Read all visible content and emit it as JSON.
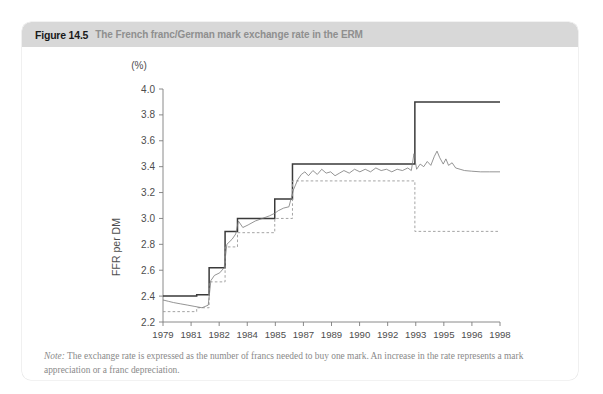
{
  "figure": {
    "number": "Figure 14.5",
    "caption": "The French franc/German mark exchange rate in the ERM",
    "note_label": "Note:",
    "note_text": " The exchange rate is expressed as the number of francs needed to buy one mark. An increase in the rate represents a mark appreciation or a franc depreciation."
  },
  "colors": {
    "header_bar": "#d8d8d8",
    "figure_number": "#1a1a1a",
    "caption": "#8f8f8f",
    "band_upper": "#3a3a3a",
    "band_lower": "#9a9a9a",
    "actual_rate": "#7a7a7a",
    "axis": "#7d7d7d",
    "tick_label": "#4d4d4d",
    "note": "#8a8a8a",
    "card_bg": "#ffffff"
  },
  "chart_data": {
    "type": "line",
    "title": "The French franc/German mark exchange rate in the ERM",
    "xlabel": "",
    "ylabel": "FFR per DM",
    "y_unit_label": "(%)",
    "xlim": [
      1979,
      1998
    ],
    "ylim": [
      2.2,
      4.0
    ],
    "yticks": [
      "4.0",
      "3.8",
      "3.6",
      "3.4",
      "3.2",
      "3.0",
      "2.8",
      "2.6",
      "2.4",
      "2.2"
    ],
    "ytick_values": [
      4.0,
      3.8,
      3.6,
      3.4,
      3.2,
      3.0,
      2.8,
      2.6,
      2.4,
      2.2
    ],
    "xticks": [
      "1979",
      "1981",
      "1982",
      "1984",
      "1985",
      "1987",
      "1989",
      "1990",
      "1992",
      "1993",
      "1995",
      "1996",
      "1998"
    ],
    "xtick_values": [
      1979,
      1981,
      1982,
      1984,
      1985,
      1987,
      1989,
      1990,
      1992,
      1993,
      1995,
      1996,
      1998
    ],
    "grid": false,
    "legend": "none",
    "series": [
      {
        "name": "ERM upper band limit",
        "style": "solid",
        "color": "#3a3a3a",
        "step": true,
        "points": [
          [
            1979.0,
            2.4
          ],
          [
            1980.9,
            2.4
          ],
          [
            1980.9,
            2.41
          ],
          [
            1981.6,
            2.41
          ],
          [
            1981.6,
            2.62
          ],
          [
            1982.5,
            2.62
          ],
          [
            1982.5,
            2.9
          ],
          [
            1983.2,
            2.9
          ],
          [
            1983.2,
            3.0
          ],
          [
            1985.3,
            3.0
          ],
          [
            1985.3,
            3.15
          ],
          [
            1986.3,
            3.15
          ],
          [
            1986.3,
            3.42
          ],
          [
            1993.2,
            3.42
          ],
          [
            1993.2,
            3.9
          ],
          [
            1998.0,
            3.9
          ]
        ]
      },
      {
        "name": "ERM lower band limit",
        "style": "dashed",
        "color": "#9a9a9a",
        "step": true,
        "points": [
          [
            1979.0,
            2.28
          ],
          [
            1980.9,
            2.28
          ],
          [
            1980.9,
            2.31
          ],
          [
            1981.6,
            2.31
          ],
          [
            1981.6,
            2.51
          ],
          [
            1982.5,
            2.51
          ],
          [
            1982.5,
            2.78
          ],
          [
            1983.2,
            2.78
          ],
          [
            1983.2,
            2.89
          ],
          [
            1985.3,
            2.89
          ],
          [
            1985.3,
            3.0
          ],
          [
            1986.3,
            3.0
          ],
          [
            1986.3,
            3.29
          ],
          [
            1993.2,
            3.29
          ],
          [
            1993.2,
            2.9
          ],
          [
            1998.0,
            2.9
          ]
        ]
      },
      {
        "name": "Actual FFR/DM exchange rate",
        "style": "solid-thin",
        "color": "#7a7a7a",
        "step": false,
        "points": [
          [
            1979.0,
            2.37
          ],
          [
            1979.3,
            2.36
          ],
          [
            1979.6,
            2.35
          ],
          [
            1980.0,
            2.34
          ],
          [
            1980.4,
            2.33
          ],
          [
            1980.8,
            2.32
          ],
          [
            1981.2,
            2.31
          ],
          [
            1981.55,
            2.33
          ],
          [
            1981.7,
            2.52
          ],
          [
            1981.9,
            2.56
          ],
          [
            1982.2,
            2.58
          ],
          [
            1982.45,
            2.62
          ],
          [
            1982.6,
            2.8
          ],
          [
            1982.9,
            2.84
          ],
          [
            1983.1,
            2.88
          ],
          [
            1983.25,
            2.98
          ],
          [
            1983.5,
            2.93
          ],
          [
            1983.8,
            2.95
          ],
          [
            1984.2,
            2.98
          ],
          [
            1984.6,
            3.0
          ],
          [
            1985.0,
            3.02
          ],
          [
            1985.3,
            3.04
          ],
          [
            1985.5,
            3.06
          ],
          [
            1985.8,
            3.08
          ],
          [
            1986.1,
            3.09
          ],
          [
            1986.35,
            3.22
          ],
          [
            1986.6,
            3.3
          ],
          [
            1986.8,
            3.34
          ],
          [
            1987.0,
            3.36
          ],
          [
            1987.2,
            3.33
          ],
          [
            1987.45,
            3.37
          ],
          [
            1987.7,
            3.34
          ],
          [
            1987.95,
            3.38
          ],
          [
            1988.2,
            3.35
          ],
          [
            1988.45,
            3.36
          ],
          [
            1988.7,
            3.33
          ],
          [
            1988.95,
            3.35
          ],
          [
            1989.2,
            3.37
          ],
          [
            1989.5,
            3.35
          ],
          [
            1989.8,
            3.38
          ],
          [
            1990.1,
            3.36
          ],
          [
            1990.4,
            3.38
          ],
          [
            1990.7,
            3.36
          ],
          [
            1991.0,
            3.39
          ],
          [
            1991.3,
            3.37
          ],
          [
            1991.6,
            3.38
          ],
          [
            1991.9,
            3.36
          ],
          [
            1992.2,
            3.38
          ],
          [
            1992.5,
            3.37
          ],
          [
            1992.8,
            3.39
          ],
          [
            1993.0,
            3.37
          ],
          [
            1993.15,
            3.5
          ],
          [
            1993.3,
            3.38
          ],
          [
            1993.5,
            3.42
          ],
          [
            1993.7,
            3.4
          ],
          [
            1993.9,
            3.44
          ],
          [
            1994.1,
            3.41
          ],
          [
            1994.3,
            3.48
          ],
          [
            1994.45,
            3.52
          ],
          [
            1994.6,
            3.47
          ],
          [
            1994.8,
            3.42
          ],
          [
            1994.95,
            3.46
          ],
          [
            1995.1,
            3.41
          ],
          [
            1995.3,
            3.43
          ],
          [
            1995.5,
            3.39
          ],
          [
            1995.75,
            3.38
          ],
          [
            1996.0,
            3.37
          ],
          [
            1996.4,
            3.365
          ],
          [
            1996.9,
            3.36
          ],
          [
            1997.4,
            3.36
          ],
          [
            1998.0,
            3.36
          ]
        ]
      }
    ]
  }
}
